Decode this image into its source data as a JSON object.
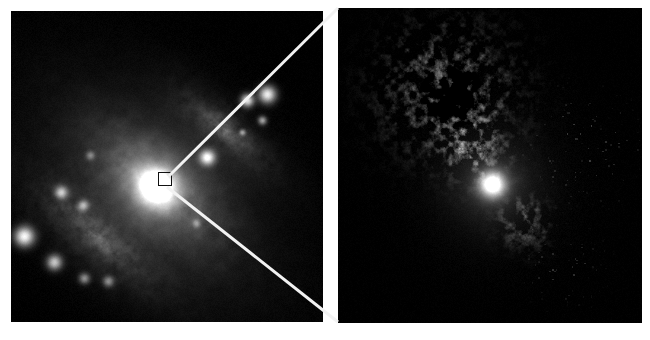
{
  "figure": {
    "title": "Two-panel astronomical image: wide-field galaxy and zoomed nuclear detail",
    "background_color": "#ffffff",
    "sky_color": "#000000",
    "callout_line_color": "#f2f2f2",
    "inset_box_color": "#101010",
    "width": 650,
    "height": 340
  },
  "panels": [
    {
      "id": "wide-field",
      "name": "Wide-field galaxy image",
      "kind": "grayscale-astronomical-image",
      "x": 11,
      "y": 11,
      "width": 312,
      "height": 311,
      "description": "Irregular/merging galaxy elongated from lower-left to upper-right with a bright saturated nucleus, a diffuse disk and a knotty tidal tail toward the lower left.",
      "inset_box": {
        "x": 158,
        "y": 172,
        "width": 14,
        "height": 14,
        "label": "zoom region marker"
      }
    },
    {
      "id": "nuclear-detail",
      "name": "Zoomed nuclear detail image",
      "kind": "grayscale-astronomical-image",
      "x": 338,
      "y": 8,
      "width": 304,
      "height": 315,
      "description": "High-resolution detail of the nuclear region showing a mottled clumpy ring-like structure with a central dark void and one bright compact knot below it."
    }
  ],
  "callout_lines": [
    {
      "name": "upper-callout-line",
      "x1": 169,
      "y1": 176,
      "x2": 338,
      "y2": 8,
      "width": 3
    },
    {
      "name": "lower-callout-line",
      "x1": 167,
      "y1": 187,
      "x2": 338,
      "y2": 322,
      "width": 3
    }
  ],
  "chart_data": {
    "type": "heatmap",
    "xlabel": "",
    "ylabel": "",
    "colormap": "grayscale",
    "legend": "none",
    "grid": false,
    "panels": [
      {
        "name": "wide-field",
        "axis_ranges": {
          "x": [
            11,
            323
          ],
          "y": [
            11,
            322
          ]
        },
        "features": [
          {
            "name": "nucleus",
            "x": 156,
            "y": 186,
            "peak_intensity": 255,
            "radius": 18,
            "type": "saturated-core"
          },
          {
            "name": "inner-disk-halo",
            "x": 156,
            "y": 186,
            "peak_intensity": 150,
            "radius": 52,
            "type": "diffuse-halo"
          },
          {
            "name": "ne-arm-knot-1",
            "x": 207,
            "y": 157,
            "peak_intensity": 230,
            "radius": 7,
            "type": "knot"
          },
          {
            "name": "ne-arm-knot-2",
            "x": 247,
            "y": 100,
            "peak_intensity": 220,
            "radius": 6,
            "type": "knot"
          },
          {
            "name": "ne-arm-knot-3",
            "x": 267,
            "y": 94,
            "peak_intensity": 235,
            "radius": 8,
            "type": "knot"
          },
          {
            "name": "ne-arm-knot-4",
            "x": 262,
            "y": 120,
            "peak_intensity": 150,
            "radius": 4,
            "type": "knot"
          },
          {
            "name": "ne-arm-knot-5",
            "x": 242,
            "y": 132,
            "peak_intensity": 130,
            "radius": 3,
            "type": "knot"
          },
          {
            "name": "ne-diffuse-arm",
            "x": 225,
            "y": 130,
            "peak_intensity": 105,
            "radius": 42,
            "type": "diffuse-arm"
          },
          {
            "name": "sw-tail-diffuse",
            "x": 95,
            "y": 235,
            "peak_intensity": 100,
            "radius": 60,
            "type": "diffuse-tail"
          },
          {
            "name": "sw-tail-knot-1",
            "x": 24,
            "y": 236,
            "peak_intensity": 245,
            "radius": 9,
            "type": "knot"
          },
          {
            "name": "sw-tail-knot-2",
            "x": 54,
            "y": 262,
            "peak_intensity": 190,
            "radius": 7,
            "type": "knot"
          },
          {
            "name": "sw-tail-knot-3",
            "x": 61,
            "y": 192,
            "peak_intensity": 175,
            "radius": 6,
            "type": "knot"
          },
          {
            "name": "sw-tail-knot-4",
            "x": 83,
            "y": 205,
            "peak_intensity": 140,
            "radius": 5,
            "type": "knot"
          },
          {
            "name": "sw-tail-knot-5",
            "x": 84,
            "y": 278,
            "peak_intensity": 130,
            "radius": 5,
            "type": "knot"
          },
          {
            "name": "sw-tail-knot-6",
            "x": 108,
            "y": 281,
            "peak_intensity": 120,
            "radius": 5,
            "type": "knot"
          },
          {
            "name": "outer-faint-knot",
            "x": 90,
            "y": 155,
            "peak_intensity": 90,
            "radius": 4,
            "type": "knot"
          },
          {
            "name": "south-faint-knot",
            "x": 196,
            "y": 223,
            "peak_intensity": 95,
            "radius": 4,
            "type": "knot"
          }
        ]
      },
      {
        "name": "nuclear-detail",
        "axis_ranges": {
          "x": [
            338,
            642
          ],
          "y": [
            8,
            323
          ]
        },
        "features": [
          {
            "name": "bright-compact-knot",
            "x": 492,
            "y": 184,
            "peak_intensity": 255,
            "radius": 13,
            "type": "saturated-knot"
          },
          {
            "name": "clumpy-ring-upper",
            "x": 448,
            "y": 90,
            "peak_intensity": 145,
            "radius": 58,
            "type": "mottled-clump-field"
          },
          {
            "name": "central-dark-void",
            "x": 452,
            "y": 98,
            "peak_intensity": 10,
            "radius": 20,
            "type": "void"
          },
          {
            "name": "clump-bridge",
            "x": 472,
            "y": 145,
            "peak_intensity": 130,
            "radius": 28,
            "type": "mottled-clump-field"
          },
          {
            "name": "lower-triangular-clump",
            "x": 524,
            "y": 222,
            "peak_intensity": 110,
            "radius": 24,
            "type": "mottled-clump-field"
          },
          {
            "name": "faint-speck-field-right",
            "x": 585,
            "y": 145,
            "peak_intensity": 70,
            "radius": 40,
            "type": "speckle"
          },
          {
            "name": "faint-speck-lower",
            "x": 565,
            "y": 268,
            "peak_intensity": 55,
            "radius": 28,
            "type": "speckle"
          }
        ]
      }
    ]
  }
}
